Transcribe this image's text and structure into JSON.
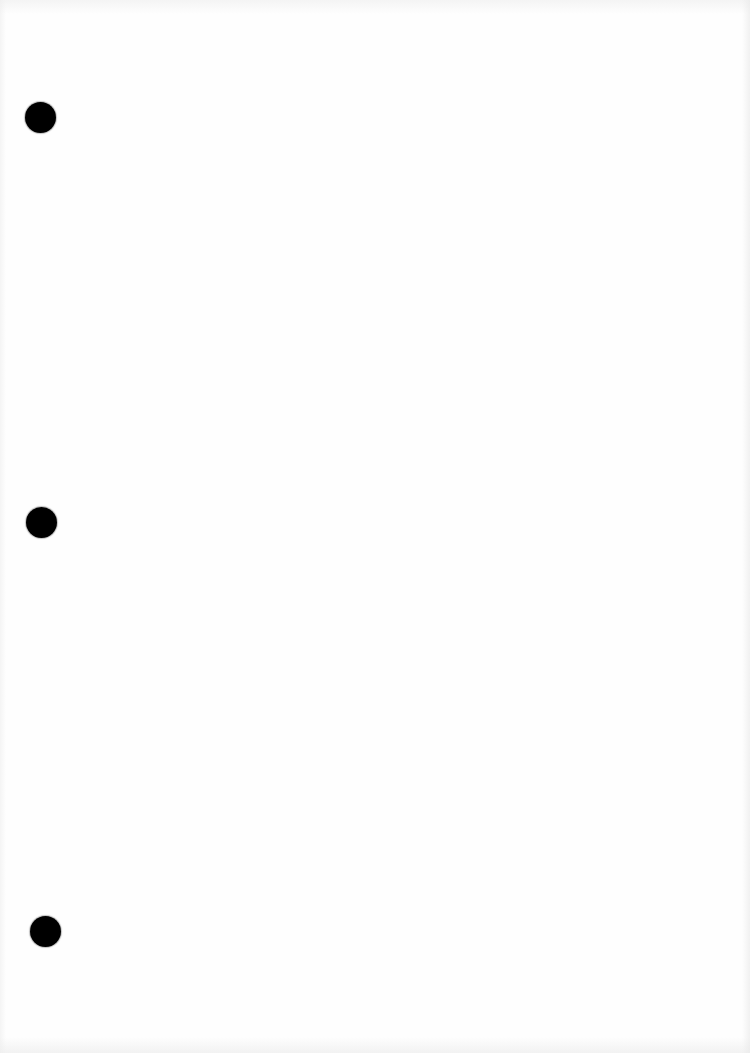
{
  "document": {
    "type": "scanned-blank-page",
    "background_color": "#fefefe",
    "text_content": "",
    "punch_holes": [
      {
        "id": "top",
        "cx": 40,
        "cy": 117,
        "diameter": 31,
        "color": "#000000"
      },
      {
        "id": "middle",
        "cx": 41,
        "cy": 522,
        "diameter": 31,
        "color": "#000000"
      },
      {
        "id": "bottom",
        "cx": 45,
        "cy": 931,
        "diameter": 31,
        "color": "#000000"
      }
    ]
  }
}
